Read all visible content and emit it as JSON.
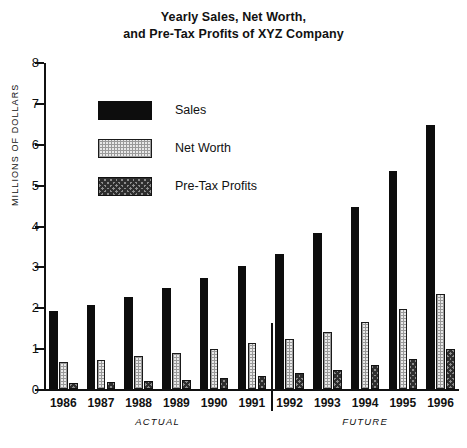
{
  "chart_data": {
    "type": "bar",
    "title": "Yearly Sales, Net Worth, and Pre-Tax Profits of XYZ Company",
    "title_line1": "Yearly Sales, Net Worth,",
    "title_line2": "and Pre-Tax Profits of XYZ Company",
    "xlabel": "",
    "ylabel": "MILLIONS OF DOLLARS",
    "ylim": [
      0,
      8
    ],
    "yticks": [
      0,
      1,
      2,
      3,
      4,
      5,
      6,
      7,
      8
    ],
    "ytick_labels": [
      "0",
      "1",
      "2",
      "3",
      "4",
      "5",
      "6",
      "7",
      "8"
    ],
    "grid": false,
    "legend_position": "upper-left-inside",
    "categories": [
      "1986",
      "1987",
      "1988",
      "1989",
      "1990",
      "1991",
      "1992",
      "1993",
      "1994",
      "1995",
      "1996"
    ],
    "series": [
      {
        "name": "Sales",
        "fill": "solid-black",
        "color": "#0d0d0d",
        "values": [
          1.9,
          2.05,
          2.25,
          2.48,
          2.72,
          3.02,
          3.3,
          3.82,
          4.45,
          5.33,
          6.45
        ]
      },
      {
        "name": "Net Worth",
        "fill": "light-stipple",
        "color": "#e9e9e9",
        "values": [
          0.65,
          0.72,
          0.8,
          0.88,
          0.98,
          1.12,
          1.22,
          1.4,
          1.63,
          1.95,
          2.32
        ]
      },
      {
        "name": "Pre-Tax Profits",
        "fill": "dark-checker",
        "color": "#8d8d8d",
        "values": [
          0.14,
          0.17,
          0.2,
          0.23,
          0.27,
          0.33,
          0.4,
          0.47,
          0.58,
          0.73,
          0.98
        ]
      }
    ],
    "annotations": [
      {
        "label": "ACTUAL",
        "spans": [
          "1986",
          "1991"
        ]
      },
      {
        "label": "FUTURE",
        "spans": [
          "1992",
          "1996"
        ]
      }
    ],
    "divider_after_category": "1991"
  }
}
